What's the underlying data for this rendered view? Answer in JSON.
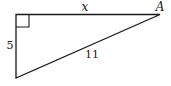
{
  "figure": {
    "type": "right-triangle",
    "vertices": {
      "right_angle": {
        "x": 16,
        "y": 14.5
      },
      "A": {
        "x": 160,
        "y": 14.5
      },
      "bottom": {
        "x": 16,
        "y": 78
      }
    },
    "right_angle_marker_size": 13,
    "stroke_color": "#1a1a1a"
  },
  "labels": {
    "top_side": "x",
    "left_side": "5",
    "hypotenuse": "11",
    "vertex_A": "A"
  }
}
